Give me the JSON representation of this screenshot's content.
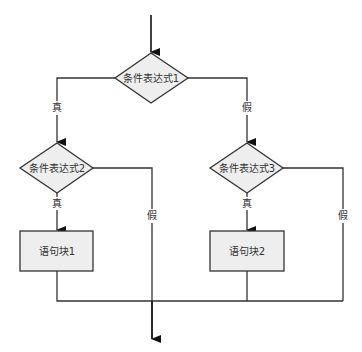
{
  "diagram": {
    "type": "flowchart",
    "nodes": {
      "cond1": {
        "label": "条件表达式1",
        "shape": "diamond"
      },
      "cond2": {
        "label": "条件表达式2",
        "shape": "diamond"
      },
      "cond3": {
        "label": "条件表达式3",
        "shape": "diamond"
      },
      "block1": {
        "label": "语句块1",
        "shape": "rect"
      },
      "block2": {
        "label": "语句块2",
        "shape": "rect"
      }
    },
    "edges": {
      "cond1_true": "真",
      "cond1_false": "假",
      "cond2_true": "真",
      "cond2_false": "假",
      "cond3_true": "真",
      "cond3_false": "假"
    },
    "colors": {
      "node_fill": "#eeeeee",
      "stroke": "#333333",
      "background": "#ffffff"
    }
  }
}
